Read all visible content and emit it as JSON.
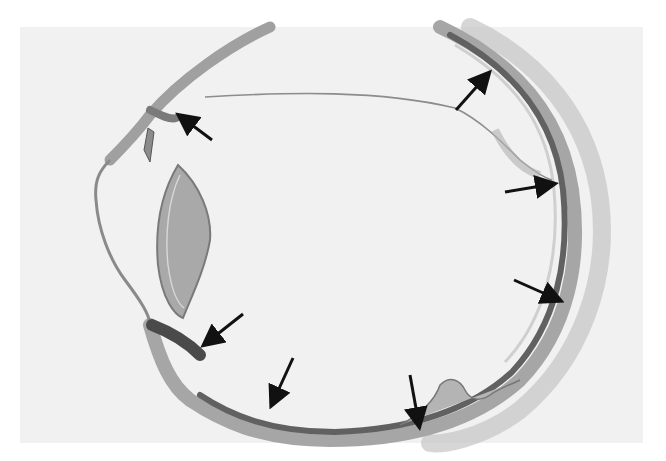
{
  "image": {
    "subject": "histological cross-section of an eye",
    "background_color": "#f1f1f1",
    "tissue_colors": {
      "sclera": "#9a9a9a",
      "choroid_retina_dark": "#5e5e5e",
      "lens": "#a8a8a8",
      "lens_capsule": "#7a7a7a",
      "outer_tissue": "#b5b5b5"
    },
    "arrow_color": "#111111",
    "arrows": [
      {
        "id": "arrow-1",
        "tail": [
          212,
          140
        ],
        "head": [
          178,
          115
        ]
      },
      {
        "id": "arrow-2",
        "tail": [
          456,
          110
        ],
        "head": [
          490,
          72
        ]
      },
      {
        "id": "arrow-3",
        "tail": [
          505,
          192
        ],
        "head": [
          556,
          183
        ]
      },
      {
        "id": "arrow-4",
        "tail": [
          514,
          280
        ],
        "head": [
          562,
          302
        ]
      },
      {
        "id": "arrow-5",
        "tail": [
          243,
          314
        ],
        "head": [
          203,
          346
        ]
      },
      {
        "id": "arrow-6",
        "tail": [
          293,
          358
        ],
        "head": [
          270,
          407
        ]
      },
      {
        "id": "arrow-7",
        "tail": [
          410,
          375
        ],
        "head": [
          420,
          428
        ]
      }
    ]
  }
}
